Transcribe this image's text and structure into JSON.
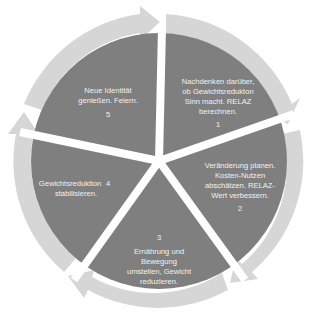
{
  "diagram": {
    "type": "cycle",
    "colors": {
      "segment_fill": "#7f7f7f",
      "ring_fill": "#d6d6d6",
      "gap": "#ffffff",
      "text": "#f2f2f2"
    },
    "segments": [
      {
        "number": "1",
        "lines": [
          "Nachdenken darüber,",
          "ob Gewichtsredukton",
          "Sinn macht. RELAZ",
          "berechnen."
        ]
      },
      {
        "number": "2",
        "lines": [
          "Veränderung planen.",
          "Kosten-Nutzen",
          "abschätzen. RELAZ-",
          "Wert verbessern."
        ]
      },
      {
        "number": "3",
        "lines": [
          "Ernährung und",
          "Bewegung",
          "umstellen, Gewicht",
          "reduzieren."
        ]
      },
      {
        "number": "4",
        "lines": [
          "Gewichtsreduktion",
          "stabilisieren."
        ]
      },
      {
        "number": "5",
        "lines": [
          "Neue Identität",
          "genießen. Feiern."
        ]
      }
    ]
  }
}
